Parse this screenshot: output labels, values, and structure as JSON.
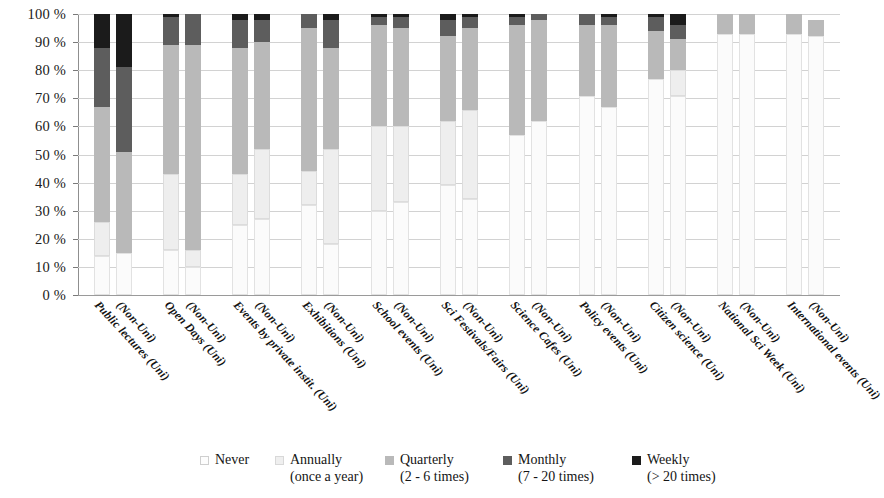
{
  "chart_data": {
    "type": "bar",
    "subtype": "stacked-percentage",
    "title": "",
    "subtitle": "",
    "xlabel": "",
    "ylabel": "",
    "ylim": [
      0,
      100
    ],
    "yticks": [
      "0 %",
      "10 %",
      "20 %",
      "30 %",
      "40 %",
      "50 %",
      "60 %",
      "70 %",
      "80 %",
      "90 %",
      "100 %"
    ],
    "grid": true,
    "legend_position": "bottom",
    "stack_order": [
      "Never",
      "Annually",
      "Quarterly",
      "Monthly",
      "Weekly"
    ],
    "categories": [
      "Public lectures (Uni)",
      "(Non-Uni)",
      "Open Days (Uni)",
      "(Non-Uni)",
      "Events by private instit. (Uni)",
      "(Non-Uni)",
      "Exhibitions (Uni)",
      "(Non-Uni)",
      "School events (Uni)",
      "(Non-Uni)",
      "Sci Festivals/Fairs (Uni)",
      "(Non-Uni)",
      "Science Cafes (Uni)",
      "(Non-Uni)",
      "Policy events (Uni)",
      "(Non-Uni)",
      "Citizen science (Uni)",
      "(Non-Uni)",
      "National Sci Week (Uni)",
      "(Non-Uni)",
      "International events (Uni)",
      "(Non-Uni)"
    ],
    "group_names": [
      "Public lectures",
      "Open Days",
      "Events by private instit.",
      "Exhibitions",
      "School events",
      "Sci Festivals/Fairs",
      "Science Cafes",
      "Policy events",
      "Citizen science",
      "National Sci Week",
      "International events"
    ],
    "series": [
      {
        "name": "Never",
        "color": "#fbfbfb",
        "values": [
          14,
          15,
          16,
          10,
          25,
          27,
          32,
          18,
          30,
          33,
          39,
          34,
          57,
          62,
          71,
          67,
          77,
          71,
          93,
          93,
          93,
          92
        ]
      },
      {
        "name": "Annually (once a year)",
        "color": "#eeeeee",
        "values": [
          12,
          0,
          27,
          6,
          18,
          25,
          12,
          34,
          30,
          27,
          23,
          32,
          0,
          0,
          0,
          0,
          0,
          9,
          0,
          0,
          0,
          0
        ]
      },
      {
        "name": "Quarterly (2 - 6 times)",
        "color": "#b9b9b9",
        "values": [
          41,
          36,
          46,
          73,
          45,
          38,
          51,
          36,
          36,
          35,
          30,
          29,
          39,
          36,
          25,
          29,
          17,
          11,
          7,
          7,
          7,
          6
        ]
      },
      {
        "name": "Monthly (7 - 20 times)",
        "color": "#5d5d5d",
        "values": [
          21,
          30,
          10,
          11,
          10,
          8,
          5,
          10,
          3,
          4,
          6,
          4,
          3,
          2,
          4,
          3,
          5,
          5,
          0,
          0,
          0,
          0
        ]
      },
      {
        "name": "Weekly (> 20 times)",
        "color": "#1b1b1b",
        "values": [
          12,
          19,
          1,
          0,
          2,
          2,
          0,
          2,
          1,
          1,
          2,
          1,
          1,
          0,
          0,
          1,
          1,
          4,
          0,
          0,
          0,
          0
        ]
      }
    ]
  },
  "legend": {
    "items": [
      {
        "swatch": "never",
        "label": "Never",
        "sub": ""
      },
      {
        "swatch": "annually",
        "label": "Annually",
        "sub": "(once a year)"
      },
      {
        "swatch": "quarterly",
        "label": "Quarterly",
        "sub": "(2 - 6 times)"
      },
      {
        "swatch": "monthly",
        "label": "Monthly",
        "sub": "(7 - 20 times)"
      },
      {
        "swatch": "weekly",
        "label": "Weekly",
        "sub": "(> 20 times)"
      }
    ]
  },
  "colors": {
    "never": "#fbfbfb",
    "annually": "#eeeeee",
    "quarterly": "#b9b9b9",
    "monthly": "#5d5d5d",
    "weekly": "#1b1b1b",
    "gridline": "#d2d2d2",
    "axis": "#8f8f8f",
    "text": "#1a1a1a"
  }
}
